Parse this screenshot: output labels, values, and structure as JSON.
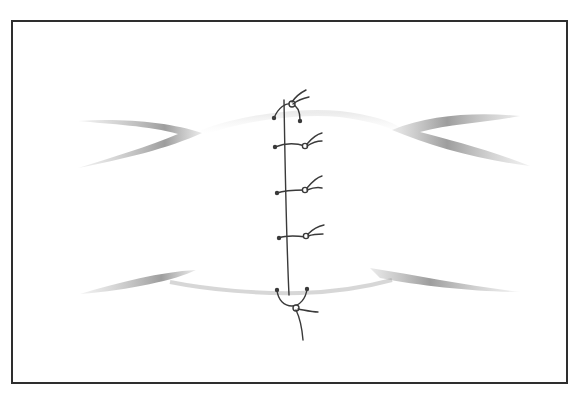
{
  "figure": {
    "type": "surgical-illustration",
    "suture": {
      "running_line": true,
      "knots": [
        {
          "label": "top-anchor-knot",
          "y": 104
        },
        {
          "label": "knot-1",
          "y": 146
        },
        {
          "label": "knot-2",
          "y": 190
        },
        {
          "label": "knot-3",
          "y": 237
        },
        {
          "label": "bottom-anchor-knot",
          "y": 294
        }
      ]
    },
    "colors": {
      "frame": "#2e2e2e",
      "ink": "#3a3a3a",
      "shading": "#8c8c8c",
      "background": "#ffffff"
    }
  },
  "caption": {
    "text": ""
  }
}
